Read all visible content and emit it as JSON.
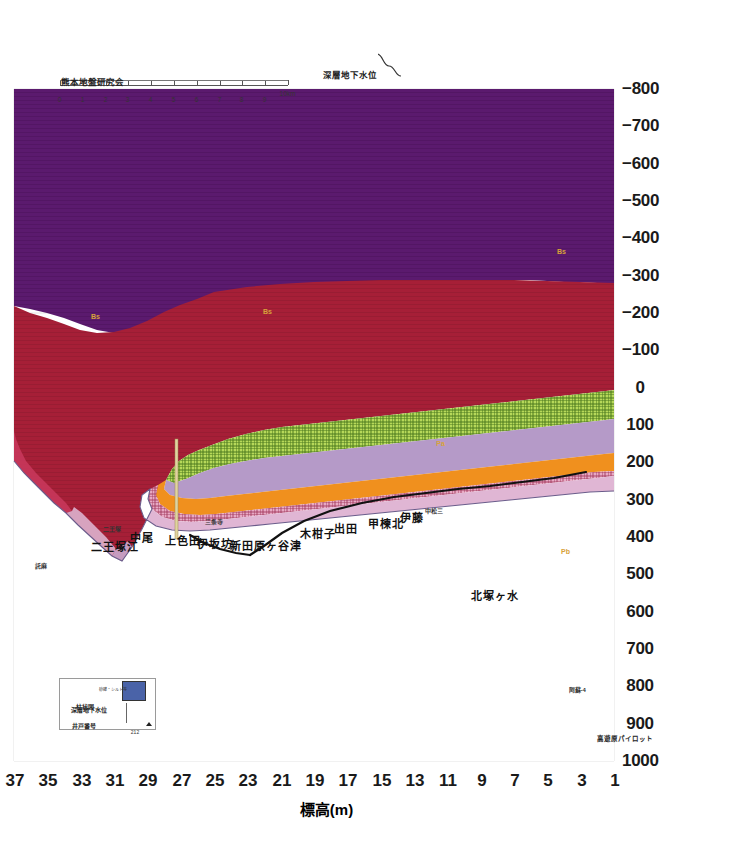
{
  "figure": {
    "caption": "図-5.6　F-F´（KD21-KD29H1）地質断面図",
    "credit": "熊本地盤研究会",
    "orientation": "rotated-90-ccw"
  },
  "axes": {
    "elevation": {
      "title": "標高(m)",
      "unit": "m",
      "ticks": [
        1000,
        900,
        800,
        700,
        600,
        500,
        400,
        300,
        200,
        100,
        0,
        -100,
        -200,
        -300,
        -400,
        -500,
        -600,
        -700,
        -800
      ],
      "tick_labels": [
        "1000",
        "900",
        "800",
        "700",
        "600",
        "500",
        "400",
        "300",
        "200",
        "100",
        "0",
        "-100",
        "-200",
        "-300",
        "-400",
        "-500",
        "-600",
        "-700",
        "-800"
      ],
      "min": -800,
      "max": 1000
    },
    "distance": {
      "unit": "km",
      "ticks": [
        1,
        3,
        5,
        7,
        9,
        11,
        13,
        15,
        17,
        19,
        21,
        23,
        25,
        27,
        29,
        31,
        33,
        35,
        37
      ],
      "tick_labels": [
        "1",
        "3",
        "5",
        "7",
        "9",
        "11",
        "13",
        "15",
        "17",
        "19",
        "21",
        "23",
        "25",
        "27",
        "29",
        "31",
        "33",
        "35",
        "37"
      ],
      "min": 1,
      "max": 37
    }
  },
  "scalebar": {
    "ticks": [
      "0",
      "1",
      "2",
      "3",
      "4",
      "5",
      "6",
      "7",
      "8",
      "9",
      "10km"
    ]
  },
  "groundwater_legend": {
    "label": "深層地下水位",
    "symbol": "wavy-line"
  },
  "legend_box": {
    "title_well": "井戸番号",
    "title_gw": "深層地下水位",
    "title_column": "柱状図",
    "well_number": "212",
    "column_caption": "砂礫・シルト等",
    "column_color": "#4a63a8"
  },
  "place_labels": [
    {
      "name": "託麻",
      "distance": 1.9,
      "size": "sm"
    },
    {
      "name": "二王塚江",
      "distance": 5.0,
      "size": "lg"
    },
    {
      "name": "二王塚",
      "distance": 5.9,
      "size": "sm"
    },
    {
      "name": "中尾",
      "distance": 7.3,
      "size": "lg"
    },
    {
      "name": "上色田",
      "distance": 9.4,
      "size": "lg"
    },
    {
      "name": "伊坂坊",
      "distance": 11.3,
      "size": "lg"
    },
    {
      "name": "三条寺",
      "distance": 12.0,
      "size": "sm"
    },
    {
      "name": "新田原ヶ谷津",
      "distance": 13.3,
      "size": "lg"
    },
    {
      "name": "木柑子",
      "distance": 17.2,
      "size": "lg"
    },
    {
      "name": "出田",
      "distance": 19.3,
      "size": "lg"
    },
    {
      "name": "甲楝北",
      "distance": 21.3,
      "size": "lg"
    },
    {
      "name": "伊藤",
      "distance": 23.2,
      "size": "lg"
    },
    {
      "name": "中松三",
      "distance": 24.9,
      "size": "sm"
    },
    {
      "name": "北塚ヶ水",
      "distance": 27.4,
      "size": "lg"
    },
    {
      "name": "高遊原パイロット",
      "distance": 35.4,
      "size": "sm"
    },
    {
      "name": "阿蘇-4",
      "distance": 33.7,
      "size": "sm"
    }
  ],
  "unit_labels": [
    {
      "code": "Pa",
      "distance": 26.3,
      "elev": 150
    },
    {
      "code": "Pb",
      "distance": 33.6,
      "elev": 460
    },
    {
      "code": "Bs",
      "distance": 33.0,
      "elev": -310
    },
    {
      "code": "Bs",
      "distance": 16.0,
      "elev": -190
    },
    {
      "code": "Bs",
      "distance": 5.5,
      "elev": -180
    },
    {
      "code": "Aso-4",
      "distance": 34.6,
      "elev": 760
    }
  ],
  "strata": [
    {
      "code": "Pa",
      "name": "先阿蘇火山岩類(上部)",
      "color": "#a61f37"
    },
    {
      "code": "Pb",
      "name": "先阿蘇火山岩類(下部)",
      "color": "#a61f37"
    },
    {
      "code": "Bs",
      "name": "基盤岩",
      "color": "#5b1a6e"
    },
    {
      "code": "As",
      "name": "阿蘇火砕流堆積物",
      "color": "#f0901e"
    },
    {
      "code": "Tk",
      "name": "託麻層",
      "color": "#b59ac8"
    },
    {
      "code": "Gr",
      "name": "砂礫層",
      "color": "#9dc53f"
    },
    {
      "code": "Hg",
      "name": "布田層",
      "color": "#e8a9c4"
    },
    {
      "code": "Ck",
      "name": "礫混じり粘土",
      "color": "#c8b56e"
    }
  ],
  "groundwater_line": {
    "name": "深層地下水位",
    "color": "#111111",
    "points": [
      {
        "d": 13.0,
        "e": 20
      },
      {
        "d": 15.0,
        "e": 35
      },
      {
        "d": 17.5,
        "e": 60
      },
      {
        "d": 19.5,
        "e": 80
      },
      {
        "d": 21.5,
        "e": 100
      },
      {
        "d": 23.0,
        "e": 120
      },
      {
        "d": 24.8,
        "e": 150
      },
      {
        "d": 26.2,
        "e": 210
      },
      {
        "d": 27.4,
        "e": 265
      },
      {
        "d": 28.4,
        "e": 305
      },
      {
        "d": 29.3,
        "e": 330
      }
    ]
  },
  "chart_data": {
    "type": "area",
    "xlabel": "",
    "ylabel": "標高(m)",
    "xlim": [
      1,
      37
    ],
    "ylim": [
      -800,
      1000
    ],
    "grid": true,
    "legend_position": "bottom-left",
    "categories": [
      1,
      3,
      5,
      7,
      9,
      11,
      13,
      15,
      17,
      19,
      21,
      23,
      25,
      27,
      29,
      31,
      33,
      35,
      37
    ],
    "series": [
      {
        "name": "地表面 (ground surface)",
        "values": [
          265,
          185,
          120,
          95,
          90,
          95,
          105,
          120,
          140,
          160,
          180,
          200,
          230,
          300,
          400,
          560,
          800,
          880,
          900
        ]
      },
      {
        "name": "Pa 上面",
        "values": [
          null,
          null,
          null,
          null,
          null,
          null,
          null,
          null,
          null,
          null,
          null,
          null,
          170,
          280,
          395,
          555,
          795,
          870,
          890
        ]
      },
      {
        "name": "Bs 上面 (基盤岩)",
        "values": [
          -205,
          -205,
          -210,
          -215,
          -220,
          -220,
          -225,
          -228,
          -230,
          -230,
          -228,
          -225,
          -220,
          -200,
          -165,
          -120,
          -60,
          -20,
          0
        ]
      }
    ]
  }
}
